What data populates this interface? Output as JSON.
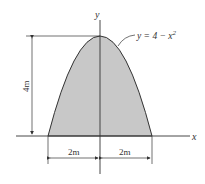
{
  "figure": {
    "curve_label": "y = 4 − x",
    "curve_exponent": "2",
    "axis_x_label": "x",
    "axis_y_label": "y",
    "height_dimension": "4m",
    "left_width_dimension": "2m",
    "right_width_dimension": "2m",
    "fill_color": "#c8c8c8",
    "line_color": "#333333"
  }
}
